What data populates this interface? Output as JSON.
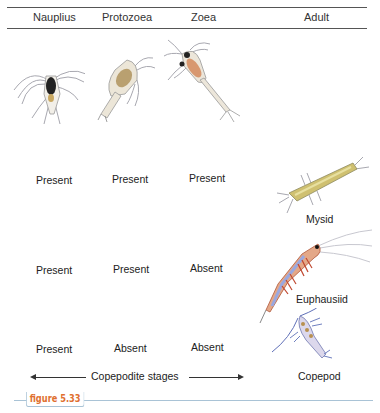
{
  "header": {
    "columns": [
      "Nauplius",
      "Protozoea",
      "Zoea",
      "Adult"
    ]
  },
  "rows": [
    {
      "adult": "Mysid",
      "stages": [
        "Present",
        "Present",
        "Present"
      ]
    },
    {
      "adult": "Euphausiid",
      "stages": [
        "Present",
        "Present",
        "Absent"
      ]
    },
    {
      "adult": "Copepod",
      "stages": [
        "Present",
        "Absent",
        "Absent"
      ]
    }
  ],
  "footer": {
    "copepodite_label": "Copepodite stages"
  },
  "caption": {
    "figure_label": "figure 5.33"
  },
  "colors": {
    "figure_tag": "#e07030",
    "caption_rule": "#a9c3d6"
  }
}
